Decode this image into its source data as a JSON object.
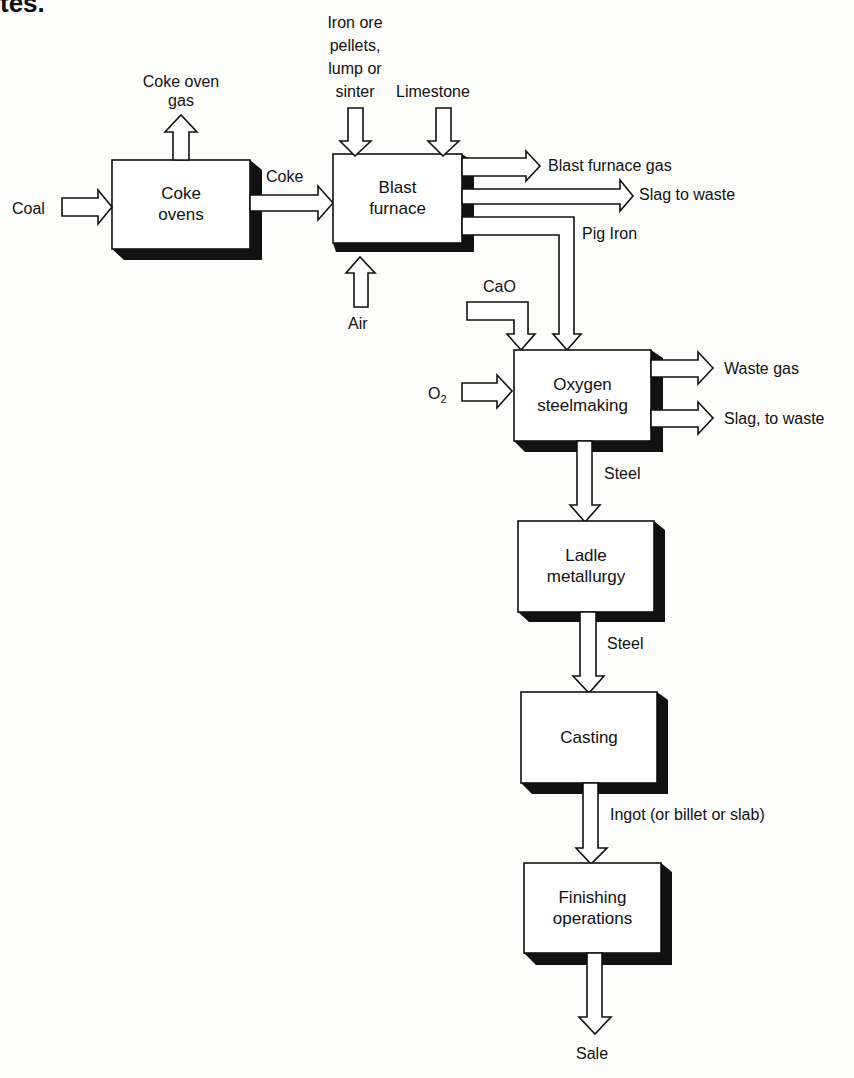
{
  "heading_fragment": "tes.",
  "processes": [
    {
      "id": "coke-ovens",
      "label_lines": [
        "Coke",
        "ovens"
      ]
    },
    {
      "id": "blast-furnace",
      "label_lines": [
        "Blast",
        "furnace"
      ]
    },
    {
      "id": "oxygen-steelmaking",
      "label_lines": [
        "Oxygen",
        "steelmaking"
      ]
    },
    {
      "id": "ladle-metallurgy",
      "label_lines": [
        "Ladle",
        "metallurgy"
      ]
    },
    {
      "id": "casting",
      "label_lines": [
        "Casting"
      ]
    },
    {
      "id": "finishing-operations",
      "label_lines": [
        "Finishing",
        "operations"
      ]
    }
  ],
  "flows": {
    "coal": "Coal",
    "coke_oven_gas": [
      "Coke oven",
      "gas"
    ],
    "coke": "Coke",
    "iron_ore": [
      "Iron ore",
      "pellets,",
      "lump or",
      "sinter"
    ],
    "limestone": "Limestone",
    "air": "Air",
    "blast_furnace_gas": "Blast furnace gas",
    "slag_to_waste": "Slag to waste",
    "pig_iron": "Pig Iron",
    "cao": "CaO",
    "o2_base": "O",
    "o2_sub": "2",
    "waste_gas": "Waste gas",
    "slag_comma_to_waste": "Slag, to waste",
    "steel_1": "Steel",
    "steel_2": "Steel",
    "ingot": "Ingot (or billet or slab)",
    "sale": "Sale"
  },
  "colors": {
    "line": "#111111",
    "fill": "#ffffff",
    "shadow": "#111111",
    "background": "#fdfdfc"
  }
}
